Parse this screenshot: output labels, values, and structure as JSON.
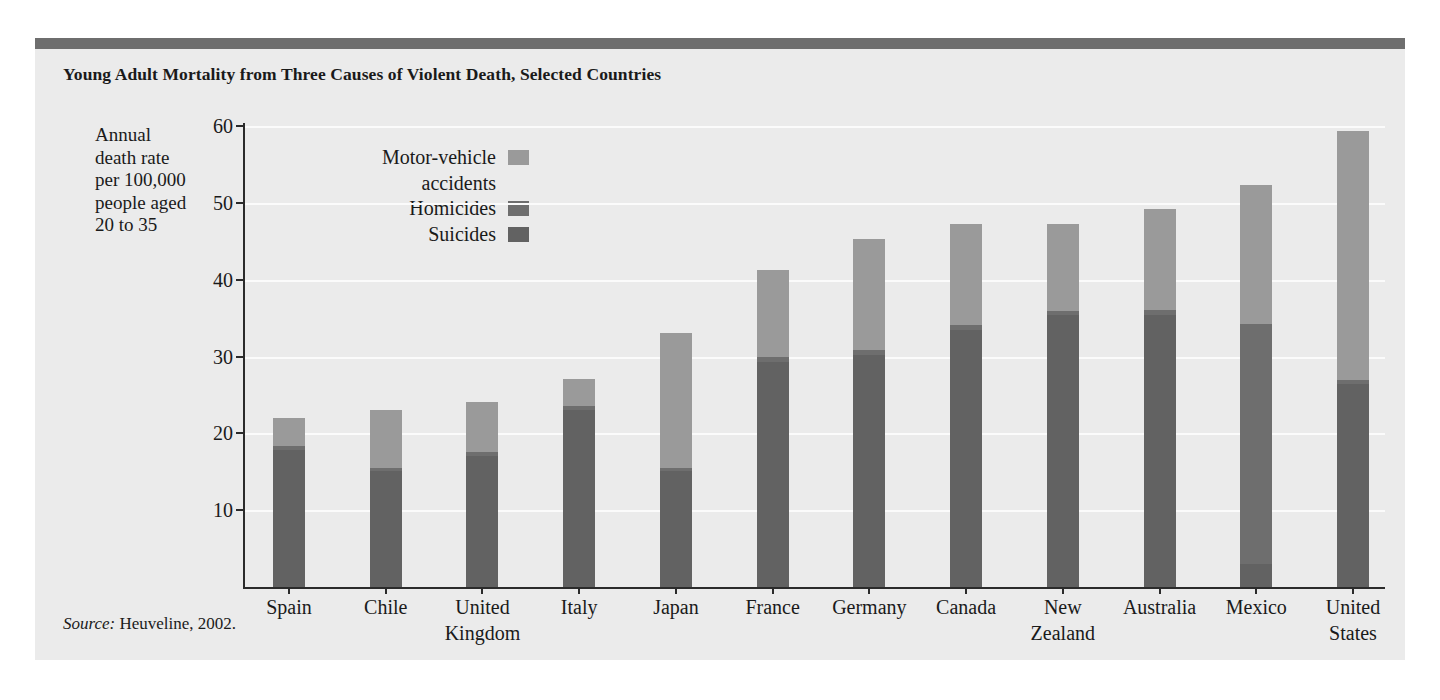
{
  "figure": {
    "title": "Young Adult Mortality from Three Causes of Violent Death, Selected Countries",
    "source_prefix": "Source:",
    "source_text": " Heuveline, 2002.",
    "panel_bg": "#ebebeb",
    "top_band_color": "#6e6e6e"
  },
  "chart_data": {
    "type": "bar",
    "subtype": "stacked-vertical",
    "title": "Young Adult Mortality from Three Causes of Violent Death, Selected Countries",
    "xlabel": "",
    "ylabel": "Annual death rate per 100,000 people aged 20 to 35",
    "ylim": [
      0,
      60
    ],
    "yticks": [
      10,
      20,
      30,
      40,
      50,
      60
    ],
    "grid": "horizontal",
    "legend_position": "inside-top-left",
    "categories": [
      "Spain",
      "Chile",
      "United Kingdom",
      "Italy",
      "Japan",
      "France",
      "Germany",
      "Canada",
      "New Zealand",
      "Australia",
      "Mexico",
      "United States"
    ],
    "category_lines": [
      [
        "Spain"
      ],
      [
        "Chile"
      ],
      [
        "United",
        "Kingdom"
      ],
      [
        "Italy"
      ],
      [
        "Japan"
      ],
      [
        "France"
      ],
      [
        "Germany"
      ],
      [
        "Canada"
      ],
      [
        "New",
        "Zealand"
      ],
      [
        "Australia"
      ],
      [
        "Mexico"
      ],
      [
        "United",
        "States"
      ]
    ],
    "series": [
      {
        "name": "Suicides",
        "color": "#626262",
        "values": [
          17.8,
          15.1,
          17.1,
          23.1,
          15.1,
          29.3,
          30.2,
          33.4,
          35.4,
          35.4,
          3.0,
          26.4
        ]
      },
      {
        "name": "Homicides",
        "color": "#6e6e6e",
        "values": [
          0.6,
          0.4,
          0.5,
          0.5,
          0.4,
          0.6,
          0.6,
          0.7,
          0.5,
          0.6,
          31.2,
          0.6
        ]
      },
      {
        "name": "Motor-vehicle accidents",
        "color": "#9a9a9a",
        "values": [
          3.6,
          7.6,
          6.5,
          3.5,
          17.6,
          11.3,
          14.5,
          13.1,
          11.3,
          13.2,
          18.1,
          32.4
        ]
      }
    ],
    "totals": [
      22.0,
      23.1,
      24.1,
      27.1,
      33.1,
      41.2,
      45.3,
      47.2,
      47.2,
      49.2,
      52.3,
      59.4
    ],
    "legend_entries": [
      {
        "label_lines": [
          "Motor-vehicle",
          "accidents"
        ],
        "color": "#9a9a9a"
      },
      {
        "label_lines": [
          "Homicides"
        ],
        "color": "#6e6e6e"
      },
      {
        "label_lines": [
          "Suicides"
        ],
        "color": "#626262"
      }
    ]
  },
  "ylabel_lines": [
    "Annual",
    "death rate",
    "per 100,000",
    "people aged",
    "20 to 35"
  ]
}
